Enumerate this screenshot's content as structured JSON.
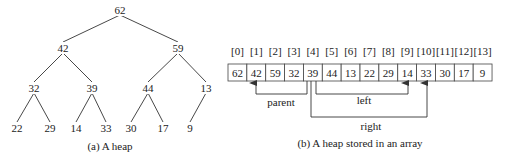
{
  "tree": {
    "caption": "(a) A heap",
    "nodes": [
      {
        "value": "62",
        "x": 120,
        "y": 10
      },
      {
        "value": "42",
        "x": 63,
        "y": 48
      },
      {
        "value": "59",
        "x": 178,
        "y": 48
      },
      {
        "value": "32",
        "x": 34,
        "y": 88
      },
      {
        "value": "39",
        "x": 92,
        "y": 88
      },
      {
        "value": "44",
        "x": 148,
        "y": 88
      },
      {
        "value": "13",
        "x": 206,
        "y": 88
      },
      {
        "value": "22",
        "x": 17,
        "y": 128
      },
      {
        "value": "29",
        "x": 50,
        "y": 128
      },
      {
        "value": "14",
        "x": 76,
        "y": 128
      },
      {
        "value": "33",
        "x": 106,
        "y": 128
      },
      {
        "value": "30",
        "x": 131,
        "y": 128
      },
      {
        "value": "17",
        "x": 163,
        "y": 128
      },
      {
        "value": "9",
        "x": 190,
        "y": 128
      }
    ],
    "edges": [
      [
        0,
        1
      ],
      [
        0,
        2
      ],
      [
        1,
        3
      ],
      [
        1,
        4
      ],
      [
        2,
        5
      ],
      [
        2,
        6
      ],
      [
        3,
        7
      ],
      [
        3,
        8
      ],
      [
        4,
        9
      ],
      [
        4,
        10
      ],
      [
        5,
        11
      ],
      [
        5,
        12
      ],
      [
        6,
        13
      ]
    ]
  },
  "array": {
    "caption": "(b) A heap stored in an array",
    "indices": [
      "[0]",
      "[1]",
      "[2]",
      "[3]",
      "[4]",
      "[5]",
      "[6]",
      "[7]",
      "[8]",
      "[9]",
      "[10]",
      "[11]",
      "[12]",
      "[13]"
    ],
    "values": [
      "62",
      "42",
      "59",
      "32",
      "39",
      "44",
      "13",
      "22",
      "29",
      "14",
      "33",
      "30",
      "17",
      "9"
    ],
    "arrows": {
      "parent": {
        "label": "parent",
        "from_index": 4,
        "to_index": 1
      },
      "left": {
        "label": "left",
        "from_index": 4,
        "to_index": 9
      },
      "right": {
        "label": "right",
        "from_index": 4,
        "to_index": 10
      }
    }
  }
}
